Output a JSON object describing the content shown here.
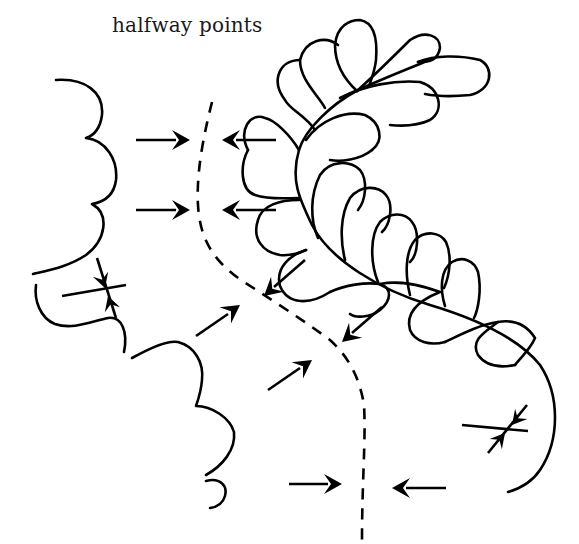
{
  "diagram": {
    "title": "halfway points",
    "stroke_color": "#000000",
    "background": "#ffffff",
    "elements": {
      "left_scallop_border": "scalloped-curve",
      "center_guide": "dashed-centerline",
      "feather_plume": "quilted-feather",
      "arrows": "halfway-point-arrows"
    }
  }
}
